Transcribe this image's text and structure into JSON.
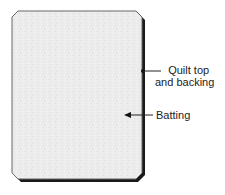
{
  "diagram": {
    "colors": {
      "fill": "#ececec",
      "outline": "#555555",
      "shadow": "#1a1a1a",
      "text": "#222222"
    },
    "labels": {
      "quilt_line1": "Quilt top",
      "quilt_line2": "and backing",
      "batting": "Batting"
    },
    "callouts": [
      {
        "name": "Quilt top and backing",
        "marker": "dot",
        "target": [
          142,
          71
        ]
      },
      {
        "name": "Batting",
        "marker": "arrowhead",
        "target": [
          125,
          115
        ]
      }
    ]
  }
}
